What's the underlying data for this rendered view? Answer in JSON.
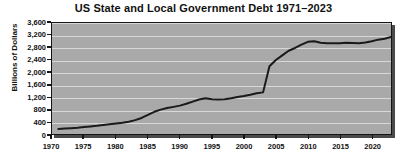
{
  "chart_data": {
    "type": "line",
    "title": "US State and Local Government Debt 1971–2023",
    "xlabel": "",
    "ylabel": "Billions of Dollars",
    "xlim": [
      1970,
      2023
    ],
    "ylim": [
      0,
      3600
    ],
    "grid": true,
    "legend": "none",
    "y_ticks": [
      0,
      400,
      800,
      1200,
      1600,
      2000,
      2400,
      2800,
      3200,
      3600
    ],
    "y_tick_labels": [
      "0",
      "400",
      "800",
      "1,200",
      "1,600",
      "2,000",
      "2,400",
      "2,800",
      "3,200",
      "3,600"
    ],
    "x_ticks": [
      1970,
      1975,
      1980,
      1985,
      1990,
      1995,
      2000,
      2005,
      2010,
      2015,
      2020
    ],
    "x_tick_labels": [
      "1970",
      "1975",
      "1980",
      "1985",
      "1990",
      "1995",
      "2000",
      "2005",
      "2010",
      "2015",
      "2020"
    ],
    "series": [
      {
        "name": "US State and Local Government Debt",
        "color": "#1a1a1a",
        "x": [
          1971,
          1972,
          1973,
          1974,
          1975,
          1976,
          1977,
          1978,
          1979,
          1980,
          1981,
          1982,
          1983,
          1984,
          1985,
          1986,
          1987,
          1988,
          1989,
          1990,
          1991,
          1992,
          1993,
          1994,
          1995,
          1996,
          1997,
          1998,
          1999,
          2000,
          2001,
          2002,
          2003,
          2004,
          2005,
          2006,
          2007,
          2008,
          2009,
          2010,
          2011,
          2012,
          2013,
          2014,
          2015,
          2016,
          2017,
          2018,
          2019,
          2020,
          2021,
          2022,
          2023
        ],
        "values": [
          160,
          175,
          190,
          205,
          225,
          245,
          265,
          290,
          315,
          340,
          365,
          400,
          450,
          520,
          620,
          720,
          790,
          840,
          880,
          920,
          980,
          1050,
          1120,
          1160,
          1130,
          1120,
          1130,
          1160,
          1200,
          1230,
          1270,
          1320,
          1350,
          2200,
          2400,
          2550,
          2700,
          2790,
          2900,
          2990,
          3010,
          2960,
          2940,
          2940,
          2940,
          2960,
          2950,
          2940,
          2970,
          3010,
          3060,
          3090,
          3150
        ]
      }
    ]
  },
  "plot_colors": {
    "background": "#a9a9a9",
    "gridline": "#d8d8d8",
    "border": "#151515",
    "line": "#1a1a1a",
    "page_background": "#ffffff"
  }
}
